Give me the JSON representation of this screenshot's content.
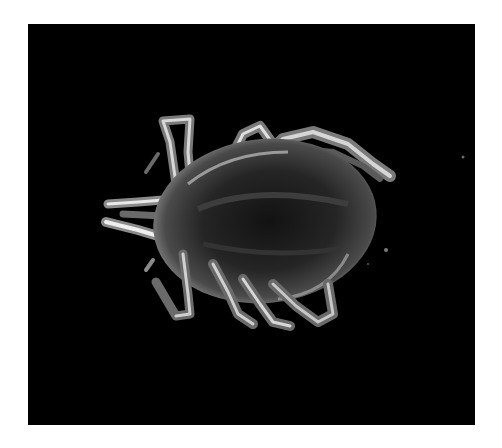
{
  "image": {
    "subject": "tick",
    "description": "Grayscale macro photograph of a tick viewed from above on a black background, head pointing left, eight legs spread",
    "colors": {
      "page_background": "#ffffff",
      "photo_background": "#000000",
      "body_dark": "#1a1a1a",
      "body_mid": "#3a3a3a",
      "body_highlight": "#8a8a8a",
      "leg_highlight": "#d8d8d8",
      "leg_mid": "#7a7a7a"
    }
  }
}
